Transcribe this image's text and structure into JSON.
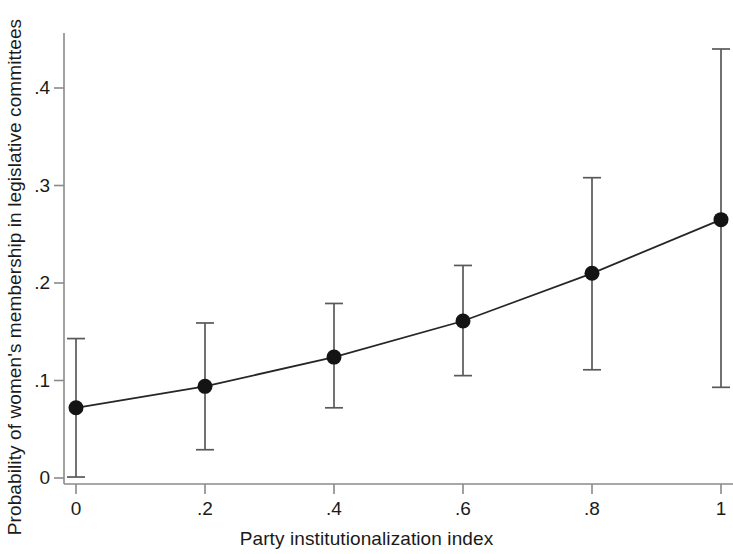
{
  "chart_data": {
    "type": "line",
    "title": "",
    "subtitle": "",
    "xlabel": "Party institutionalization index",
    "ylabel": "Probability of women's membership in legislative committees",
    "x": [
      0,
      0.2,
      0.4,
      0.6,
      0.8,
      1
    ],
    "values": [
      0.072,
      0.094,
      0.124,
      0.161,
      0.21,
      0.265
    ],
    "error_lower": [
      0.001,
      0.029,
      0.072,
      0.105,
      0.111,
      0.093
    ],
    "error_upper": [
      0.143,
      0.159,
      0.179,
      0.218,
      0.308,
      0.44
    ],
    "series": [
      {
        "name": "Predicted probability",
        "values": [
          0.072,
          0.094,
          0.124,
          0.161,
          0.21,
          0.265
        ],
        "ci_low": [
          0.001,
          0.029,
          0.072,
          0.105,
          0.111,
          0.093
        ],
        "ci_high": [
          0.143,
          0.159,
          0.179,
          0.218,
          0.308,
          0.44
        ]
      }
    ],
    "xlim": [
      -0.03,
      1.04
    ],
    "ylim": [
      0,
      0.46
    ],
    "xticks": [
      0,
      0.2,
      0.4,
      0.6,
      0.8,
      1
    ],
    "xtick_labels": [
      "0",
      ".2",
      ".4",
      ".6",
      ".8",
      "1"
    ],
    "yticks": [
      0,
      0.1,
      0.2,
      0.3,
      0.4
    ],
    "ytick_labels": [
      "0",
      ".1",
      ".2",
      ".3",
      ".4"
    ],
    "grid": false,
    "legend": null,
    "legend_position": "none",
    "marker": "filled-circle",
    "errorbar_style": "capped-vertical",
    "colors": {
      "line": "#262626",
      "marker": "#141414",
      "errorbar": "#595959",
      "axis": "#7a7a7a",
      "text": "#1a1a1a",
      "background": "#ffffff"
    }
  }
}
